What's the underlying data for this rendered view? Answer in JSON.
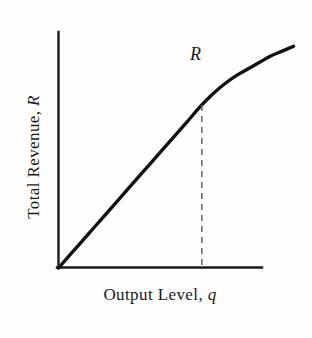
{
  "chart_data": {
    "type": "line",
    "title": "",
    "xlabel_prefix": "Output Level, ",
    "xlabel_symbol": "q",
    "ylabel_prefix": "Total Revenue, ",
    "ylabel_symbol": "R",
    "curve_label": "R",
    "grid": false,
    "legend": "none",
    "axis_ticks": [],
    "tick_labels": [],
    "annotations": [
      {
        "name": "kink-dropline",
        "style": "dashed",
        "from_curve_point": true,
        "x": 1.0,
        "y": 1.0
      }
    ],
    "axis_origin_label": "",
    "xlim": [
      0,
      1.65
    ],
    "ylim": [
      0,
      1.38
    ],
    "series": [
      {
        "name": "R",
        "description": "Total revenue: linear through origin up to the kink, then concave and flattening",
        "x": [
          0.0,
          0.1,
          0.2,
          0.3,
          0.4,
          0.5,
          0.6,
          0.7,
          0.8,
          0.9,
          1.0,
          1.08,
          1.16,
          1.24,
          1.32,
          1.4,
          1.48,
          1.56,
          1.64
        ],
        "y": [
          0.0,
          0.1,
          0.2,
          0.3,
          0.4,
          0.5,
          0.6,
          0.7,
          0.8,
          0.9,
          1.0,
          1.07,
          1.13,
          1.18,
          1.22,
          1.26,
          1.3,
          1.33,
          1.36
        ]
      }
    ]
  },
  "figure": {
    "axis_color": "#1a1a1a",
    "curve_color": "#111111",
    "dash_color": "#6b6b6b",
    "background": "#fdfdfd"
  }
}
